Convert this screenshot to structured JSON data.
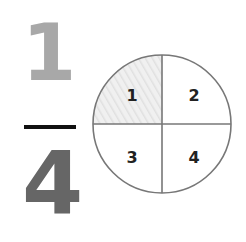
{
  "fraction": {
    "numerator": "1",
    "denominator": "4",
    "numerator_color": "#a8a8a8",
    "denominator_color": "#666666"
  },
  "circle": {
    "quadrants": [
      {
        "label": "1",
        "shaded": true
      },
      {
        "label": "2",
        "shaded": false
      },
      {
        "label": "3",
        "shaded": false
      },
      {
        "label": "4",
        "shaded": false
      }
    ],
    "shade_color": "#ececec",
    "stroke_color": "#777777"
  }
}
